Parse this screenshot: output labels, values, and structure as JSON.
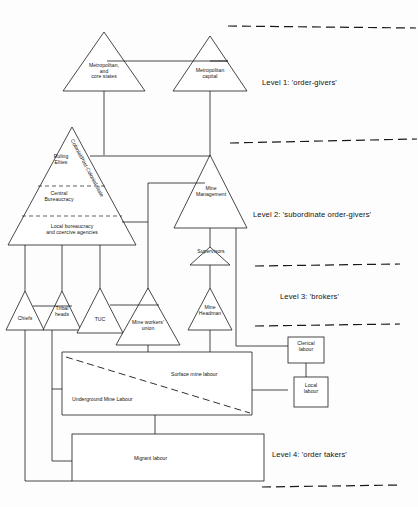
{
  "diagram": {
    "background_color": "#fdfdfd",
    "line_color": "#1a1a1a"
  },
  "levels": [
    {
      "id": "level-1",
      "label": "Level 1: 'order-givers'"
    },
    {
      "id": "level-2",
      "label": "Level 2: 'subordinate order-givers'"
    },
    {
      "id": "level-3",
      "label": "Level 3: 'brokers'"
    },
    {
      "id": "level-4",
      "label": "Level 4: 'order takers'"
    }
  ],
  "nodes": {
    "metropolitan_core_states": "Metropolitan,\nand\ncore states",
    "metropolitan_capital": "Metropolitan\ncapital",
    "state_rotated": "Colonial/Post-Colonial State",
    "ruling_elites": "Ruling\nElites",
    "central_bureaucracy": "Central\nBureaucracy",
    "local_bureaucracy": "Local bureaucracy\nand coercive agencies",
    "mine_management": "Mine\nManagement",
    "supervisors": "Supervisors",
    "chiefs": "Chiefs",
    "tribal_heads": "Tribal\nheads",
    "tuc": "TUC",
    "mine_workers_union": "Mine workers'\nunion",
    "mine_headman": "Mine\nHeadman",
    "surface_mine_labour": "Surface mine labour",
    "underground_mine_labour": "Underground Mine Labour",
    "clerical_labour": "Clerical\nlabour",
    "local_labour": "Local\nlabour",
    "migrant_labour": "Migrant labour"
  }
}
